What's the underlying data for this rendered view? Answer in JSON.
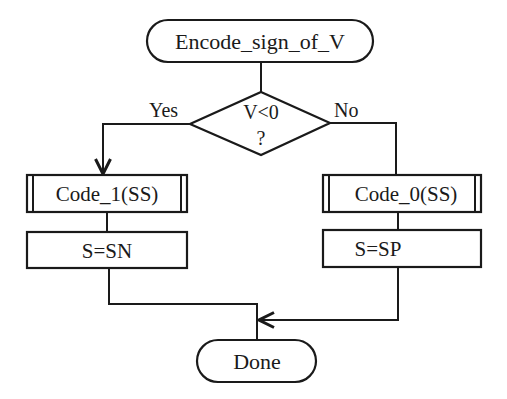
{
  "diagram": {
    "type": "flowchart",
    "start": {
      "label": "Encode_sign_of_V",
      "shape": "terminator"
    },
    "decision": {
      "line1": "V<0",
      "line2": "?",
      "shape": "diamond"
    },
    "branches": {
      "yes": {
        "label": "Yes",
        "steps": [
          {
            "label": "Code_1(SS)",
            "shape": "predefined-process"
          },
          {
            "label": "S=SN",
            "shape": "process"
          }
        ]
      },
      "no": {
        "label": "No",
        "steps": [
          {
            "label": "Code_0(SS)",
            "shape": "predefined-process"
          },
          {
            "label": "S=SP",
            "shape": "process"
          }
        ]
      }
    },
    "end": {
      "label": "Done",
      "shape": "terminator"
    },
    "colors": {
      "stroke": "#1a1a1a",
      "fill": "#ffffff",
      "background": "#ffffff"
    }
  }
}
